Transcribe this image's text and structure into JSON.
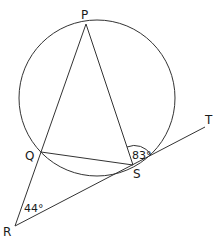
{
  "figure": {
    "type": "circle-geometry",
    "points": {
      "P": {
        "label": "P",
        "x": 86,
        "y": 24
      },
      "Q": {
        "label": "Q",
        "x": 41,
        "y": 152
      },
      "S": {
        "label": "S",
        "x": 133,
        "y": 165
      },
      "R": {
        "label": "R",
        "x": 15,
        "y": 226
      },
      "T": {
        "label": "T",
        "x": 205,
        "y": 127
      }
    },
    "circle": {
      "cx": 97,
      "cy": 98,
      "r": 78
    },
    "angles": {
      "PST": "83°",
      "QRS": "44°"
    },
    "line_color": "#333333"
  }
}
